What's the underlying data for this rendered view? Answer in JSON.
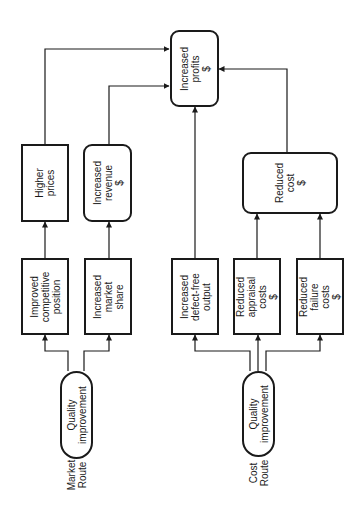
{
  "diagram": {
    "nodes": {
      "increased_profits": "Increased\nprofits\n$",
      "higher_prices": "Higher\nprices",
      "increased_revenue": "Increased\nrevenue\n$",
      "improved_competitive_position": "Improved\ncompetitive\nposition",
      "increased_market_share": "Increased\nmarket\nshare",
      "increased_defect_free_output": "Increased\ndefect-free\noutput",
      "reduced_appraisal_costs": "Reduced\nappraisal\ncosts\n$",
      "reduced_failure_costs": "Reduced\nfailure\ncosts\n$",
      "reduced_cost": "Reduced\ncost\n$",
      "quality_improvement_market": "Quality\nimprovement",
      "quality_improvement_cost": "Quality\nimprovement"
    },
    "routes": {
      "market": "Market\nRoute",
      "cost": "Cost\nRoute"
    },
    "edges": [
      {
        "from": "quality_improvement_market",
        "to": "improved_competitive_position"
      },
      {
        "from": "quality_improvement_market",
        "to": "increased_market_share"
      },
      {
        "from": "improved_competitive_position",
        "to": "higher_prices"
      },
      {
        "from": "increased_market_share",
        "to": "increased_revenue"
      },
      {
        "from": "higher_prices",
        "to": "increased_profits"
      },
      {
        "from": "increased_revenue",
        "to": "increased_profits"
      },
      {
        "from": "quality_improvement_cost",
        "to": "increased_defect_free_output"
      },
      {
        "from": "quality_improvement_cost",
        "to": "reduced_appraisal_costs"
      },
      {
        "from": "quality_improvement_cost",
        "to": "reduced_failure_costs"
      },
      {
        "from": "increased_defect_free_output",
        "to": "increased_profits"
      },
      {
        "from": "reduced_appraisal_costs",
        "to": "reduced_cost"
      },
      {
        "from": "reduced_failure_costs",
        "to": "reduced_cost"
      },
      {
        "from": "reduced_cost",
        "to": "increased_profits"
      }
    ],
    "colors": {
      "stroke": "#1a1a1a",
      "background": "#ffffff"
    }
  }
}
